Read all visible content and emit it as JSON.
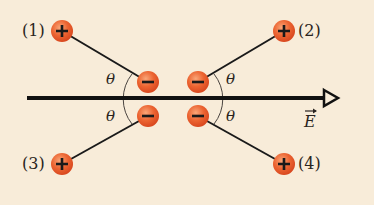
{
  "diagram": {
    "field_label": "E",
    "angle_label": "θ",
    "colors": {
      "background": "#f8ecd9",
      "charge_fill": "#e8582a",
      "charge_highlight": "#f79a6a",
      "line": "#1a1a1a"
    },
    "dipoles": [
      {
        "id": "(1)",
        "positive": "+",
        "negative": "−"
      },
      {
        "id": "(2)",
        "positive": "+",
        "negative": "−"
      },
      {
        "id": "(3)",
        "positive": "+",
        "negative": "−"
      },
      {
        "id": "(4)",
        "positive": "+",
        "negative": "−"
      }
    ]
  }
}
